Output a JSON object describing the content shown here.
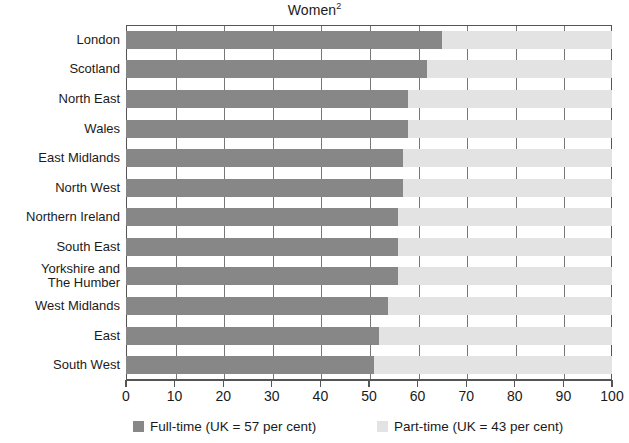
{
  "chart_data": {
    "type": "bar",
    "orientation": "horizontal",
    "stacked": true,
    "title": "Women",
    "title_superscript": "2",
    "xlabel": "",
    "ylabel": "",
    "xlim": [
      0,
      100
    ],
    "xticks": [
      0,
      10,
      20,
      30,
      40,
      50,
      60,
      70,
      80,
      90,
      100
    ],
    "xtick_labels": [
      "0",
      "10",
      "20",
      "30",
      "40",
      "50",
      "60",
      "70",
      "80",
      "90",
      "100"
    ],
    "grid": true,
    "grid_axis": "x",
    "legend_position": "bottom",
    "categories": [
      "London",
      "Scotland",
      "North East",
      "Wales",
      "East Midlands",
      "North West",
      "Northern Ireland",
      "South East",
      "Yorkshire and\nThe Humber",
      "West Midlands",
      "East",
      "South West"
    ],
    "series": [
      {
        "name": "Full-time (UK = 57 per cent)",
        "short_name": "Full-time",
        "uk_average": 57,
        "color": "#878787",
        "values": [
          65,
          62,
          58,
          58,
          57,
          57,
          56,
          56,
          56,
          54,
          52,
          51
        ]
      },
      {
        "name": "Part-time (UK = 43 per cent)",
        "short_name": "Part-time",
        "uk_average": 43,
        "color": "#e3e3e3",
        "values": [
          35,
          38,
          42,
          42,
          43,
          43,
          44,
          44,
          44,
          46,
          48,
          49
        ]
      }
    ]
  },
  "legend": {
    "items": [
      {
        "label": "Full-time (UK = 57 per cent)",
        "color": "#878787"
      },
      {
        "label": "Part-time (UK = 43 per cent)",
        "color": "#e3e3e3"
      }
    ]
  },
  "colors": {
    "full_time": "#878787",
    "part_time": "#e3e3e3",
    "axis": "#555555",
    "gridline": "#777777",
    "text": "#1a1a1a",
    "background": "#ffffff"
  }
}
